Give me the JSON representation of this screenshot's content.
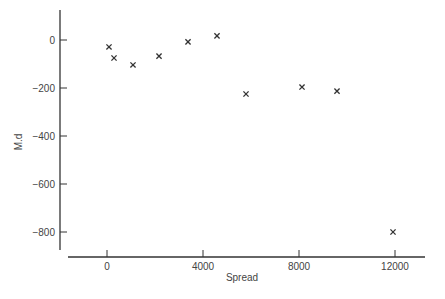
{
  "chart_data": {
    "type": "scatter",
    "title": "",
    "xlabel": "Spread",
    "ylabel": "M.d",
    "xlim": [
      -1500,
      13300
    ],
    "ylim": [
      -880,
      130
    ],
    "xticks": [
      0,
      4000,
      8000,
      12000
    ],
    "xtick_labels": [
      "0",
      "4000",
      "8000",
      "12000"
    ],
    "yticks": [
      0,
      -200,
      -400,
      -600,
      -800
    ],
    "ytick_labels": [
      "0",
      "−200",
      "−400",
      "−600",
      "−800"
    ],
    "grid": false,
    "legend": null,
    "marker": "x",
    "points": [
      {
        "x": 83,
        "y": -29
      },
      {
        "x": 292,
        "y": -75
      },
      {
        "x": 1083,
        "y": -104
      },
      {
        "x": 2167,
        "y": -67
      },
      {
        "x": 3375,
        "y": -8
      },
      {
        "x": 4583,
        "y": 17
      },
      {
        "x": 5792,
        "y": -225
      },
      {
        "x": 8125,
        "y": -196
      },
      {
        "x": 9583,
        "y": -213
      },
      {
        "x": 11917,
        "y": -800
      }
    ]
  },
  "colors": {
    "axis": "#333333",
    "marker": "#333333",
    "text": "#444444"
  }
}
